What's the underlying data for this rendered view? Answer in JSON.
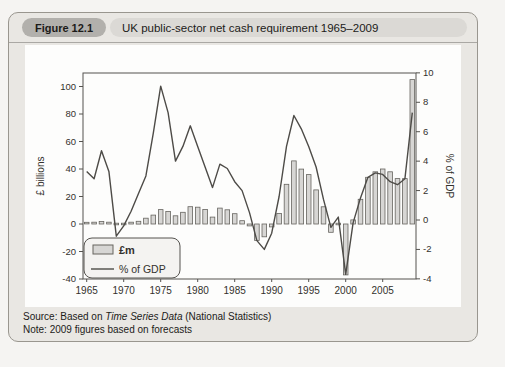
{
  "header": {
    "figure_label": "Figure 12.1",
    "title": "UK public-sector net cash requirement 1965–2009"
  },
  "footer": {
    "source_prefix": "Source: Based on ",
    "source_italic": "Time Series Data",
    "source_suffix": " (National Statistics)",
    "note": "Note: 2009 figures based on forecasts"
  },
  "colors": {
    "ui": {
      "page-bg": "#f5f4f2",
      "panel-bg": "#e9e7e3",
      "panel-border": "#99968f",
      "pill-bg": "#b2b0ac",
      "titlebar-bg": "#dbd9d5",
      "divider": "#aaa8a4",
      "card-bg": "#fdfdfc",
      "ink": "#1c1b19"
    }
  },
  "chart_data": {
    "type": "bar+line",
    "title": "UK public-sector net cash requirement 1965–2009",
    "years": [
      1965,
      1966,
      1967,
      1968,
      1969,
      1970,
      1971,
      1972,
      1973,
      1974,
      1975,
      1976,
      1977,
      1978,
      1979,
      1980,
      1981,
      1982,
      1983,
      1984,
      1985,
      1986,
      1987,
      1988,
      1989,
      1990,
      1991,
      1992,
      1993,
      1994,
      1995,
      1996,
      1997,
      1998,
      1999,
      2000,
      2001,
      2002,
      2003,
      2004,
      2005,
      2006,
      2007,
      2008,
      2009
    ],
    "bars": {
      "name": "£m",
      "axis": "left",
      "values": [
        1.2,
        1.3,
        1.9,
        1.3,
        -0.5,
        0.3,
        1.3,
        2.0,
        4.2,
        6.5,
        10.5,
        9.1,
        6.0,
        8.5,
        12.6,
        12.2,
        10.6,
        5.0,
        11.6,
        10.3,
        7.5,
        2.4,
        -1.4,
        -11.9,
        -9.3,
        -2.1,
        7.7,
        28.9,
        45.9,
        39.9,
        35.9,
        24.8,
        12.5,
        -6.0,
        -1.0,
        -37.0,
        3.0,
        18.0,
        34.0,
        38.0,
        40.0,
        38.0,
        33.0,
        33.0,
        105.0
      ]
    },
    "line": {
      "name": "% of GDP",
      "axis": "right",
      "values": [
        3.3,
        2.8,
        4.7,
        3.3,
        -1.1,
        -0.4,
        0.6,
        1.8,
        3.0,
        5.9,
        9.1,
        7.3,
        4.0,
        5.0,
        6.4,
        5.0,
        3.6,
        2.2,
        3.8,
        3.5,
        2.6,
        2.0,
        0.5,
        -1.4,
        -2.0,
        -0.9,
        1.6,
        5.0,
        7.1,
        6.2,
        5.0,
        3.6,
        1.4,
        -0.5,
        0.2,
        -3.7,
        -0.2,
        1.5,
        2.9,
        3.2,
        3.1,
        2.6,
        2.4,
        2.8,
        7.3
      ]
    },
    "left_axis": {
      "label": "£ billions",
      "ticks": [
        -40,
        -20,
        0,
        20,
        40,
        60,
        80,
        100
      ],
      "range": [
        -40,
        110
      ]
    },
    "right_axis": {
      "label": "% of GDP",
      "ticks": [
        -4,
        -2,
        0,
        2,
        4,
        6,
        8,
        10
      ],
      "range": [
        -4,
        10
      ]
    },
    "x_axis": {
      "ticks": [
        1965,
        1970,
        1975,
        1980,
        1985,
        1990,
        1995,
        2000,
        2005
      ]
    },
    "legend": [
      "£m",
      "% of GDP"
    ],
    "legend_position": "bottom-left",
    "grid": false,
    "colors": {
      "bar_fill": "#d7d6d4",
      "bar_stroke": "#66645f",
      "line": "#4d4b47",
      "axis": "#55534f",
      "text": "#33312d",
      "legend_bg": "#f4f3f1"
    }
  }
}
